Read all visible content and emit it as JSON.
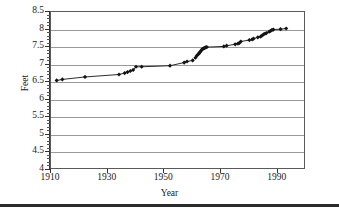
{
  "chart_data": {
    "type": "line",
    "title": "",
    "xlabel": "Year",
    "ylabel": "Feet",
    "xlim": [
      1910,
      2000
    ],
    "ylim": [
      4,
      8.5
    ],
    "grid": true,
    "legend": false,
    "legend_position": "none",
    "marker": "diamond",
    "x_ticks": [
      1910,
      1930,
      1950,
      1970,
      1990
    ],
    "x_tick_labels": [
      "1910",
      "1930",
      "1950",
      "1970",
      "1990"
    ],
    "y_ticks": [
      4,
      4.5,
      5,
      5.5,
      6,
      6.5,
      7,
      7.5,
      8,
      8.5
    ],
    "y_tick_labels": [
      "4",
      "4.5",
      "5",
      "5.5",
      "6",
      "6.5",
      "7",
      "7.5",
      "8",
      "8.5"
    ],
    "y_minor_tick_step": 0.1,
    "series": [
      {
        "name": "Record",
        "color": "#141414",
        "x": [
          1912,
          1914,
          1922,
          1934,
          1936,
          1937,
          1938,
          1939,
          1940,
          1942,
          1952,
          1957,
          1958,
          1960,
          1961,
          1961.5,
          1962,
          1962.3,
          1962.6,
          1963,
          1963.3,
          1963.6,
          1964,
          1964.3,
          1964.6,
          1965,
          1971,
          1972,
          1975,
          1976,
          1976.5,
          1977,
          1980,
          1981,
          1981.5,
          1983,
          1984,
          1984.5,
          1985,
          1985.5,
          1986,
          1987,
          1987.5,
          1988,
          1988.5,
          1991,
          1993
        ],
        "y": [
          6.55,
          6.58,
          6.65,
          6.72,
          6.76,
          6.79,
          6.82,
          6.85,
          6.94,
          6.94,
          6.97,
          7.06,
          7.09,
          7.12,
          7.2,
          7.26,
          7.3,
          7.33,
          7.36,
          7.4,
          7.43,
          7.45,
          7.47,
          7.48,
          7.49,
          7.5,
          7.52,
          7.54,
          7.58,
          7.6,
          7.62,
          7.66,
          7.7,
          7.72,
          7.74,
          7.78,
          7.8,
          7.83,
          7.86,
          7.88,
          7.9,
          7.94,
          7.96,
          7.99,
          8.0,
          8.01,
          8.03
        ]
      }
    ]
  },
  "axis": {
    "y_title": "Feet",
    "x_title": "Year"
  }
}
